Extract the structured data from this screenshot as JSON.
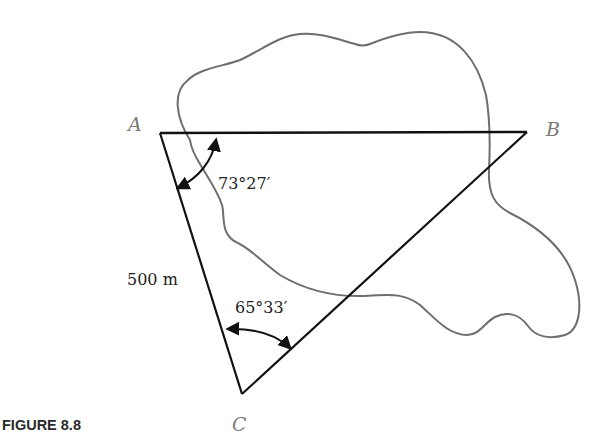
{
  "figure": {
    "caption": "FIGURE 8.8",
    "vertices": {
      "a": "A",
      "b": "B",
      "c": "C"
    },
    "side_ac_label": "500 m",
    "angle_a_label": "73°27′",
    "angle_c_label": "65°33′",
    "colors": {
      "triangle": "#111111",
      "boundary": "#6e6e6e",
      "vertex_label": "#7a7a7a"
    }
  }
}
